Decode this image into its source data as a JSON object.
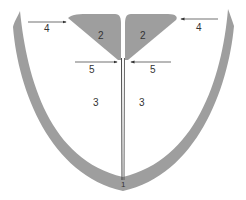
{
  "colors": {
    "shape_fill": "#9e9e9e",
    "line": "#333333",
    "background": "#ffffff"
  },
  "labels": {
    "l1": "1",
    "l2_left": "2",
    "l2_right": "2",
    "l3_left": "3",
    "l3_right": "3",
    "l4_left": "4",
    "l4_right": "4",
    "l5_left": "5",
    "l5_right": "5"
  }
}
